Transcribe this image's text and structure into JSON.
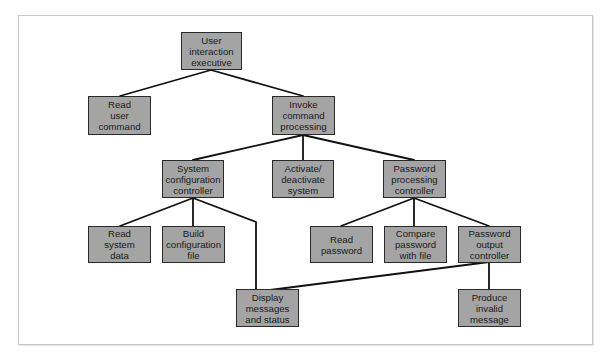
{
  "diagram": {
    "type": "hierarchy-chart",
    "colors": {
      "node_fill": "#a4a4a4",
      "node_border": "#2a2a2a",
      "line": "#111111",
      "frame": "#c8c8c8"
    },
    "nodes": [
      {
        "id": "n0",
        "label": "User\ninteraction\nexecutive"
      },
      {
        "id": "n1",
        "label": "Read\nuser\ncommand"
      },
      {
        "id": "n2",
        "label": "Invoke\ncommand\nprocessing"
      },
      {
        "id": "n3",
        "label": "System\nconfiguration\ncontroller"
      },
      {
        "id": "n4",
        "label": "Activate/\ndeactivate\nsystem"
      },
      {
        "id": "n5",
        "label": "Password\nprocessing\ncontroller"
      },
      {
        "id": "n6",
        "label": "Read\nsystem\ndata"
      },
      {
        "id": "n7",
        "label": "Build\nconfiguration\nfile"
      },
      {
        "id": "n8",
        "label": "Read\npassword"
      },
      {
        "id": "n9",
        "label": "Compare\npassword\nwith file"
      },
      {
        "id": "n10",
        "label": "Password\noutput\ncontroller"
      },
      {
        "id": "n11",
        "label": "Display\nmessages\nand status"
      },
      {
        "id": "n12",
        "label": "Produce\ninvalid\nmessage"
      }
    ],
    "edges": [
      {
        "from": "User interaction executive",
        "to": "Read user command"
      },
      {
        "from": "User interaction executive",
        "to": "Invoke command processing"
      },
      {
        "from": "Invoke command processing",
        "to": "System configuration controller"
      },
      {
        "from": "Invoke command processing",
        "to": "Activate/deactivate system"
      },
      {
        "from": "Invoke command processing",
        "to": "Password processing controller"
      },
      {
        "from": "System configuration controller",
        "to": "Read system data"
      },
      {
        "from": "System configuration controller",
        "to": "Build configuration file"
      },
      {
        "from": "System configuration controller",
        "to": "Display messages and status"
      },
      {
        "from": "Password processing controller",
        "to": "Read password"
      },
      {
        "from": "Password processing controller",
        "to": "Compare password with file"
      },
      {
        "from": "Password processing controller",
        "to": "Password output controller"
      },
      {
        "from": "Password output controller",
        "to": "Display messages and status"
      },
      {
        "from": "Password output controller",
        "to": "Produce invalid message"
      }
    ]
  }
}
